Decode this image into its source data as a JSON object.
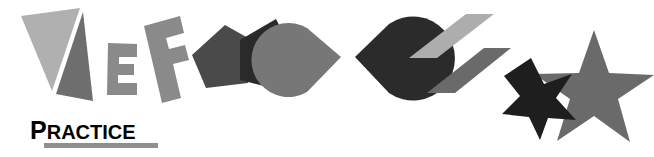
{
  "page": {
    "width": 654,
    "height": 157,
    "background": "#ffffff"
  },
  "heading": {
    "full_text": "PRACTICE",
    "drop_cap": "P",
    "rest": "RACTICE",
    "underline_color": "#8f8f8f",
    "text_color": "#000000"
  },
  "figure": {
    "pairs": [
      {
        "name": "triangle-pair",
        "shape": "triangle",
        "count": 2,
        "colors": [
          "#b0b0b0",
          "#6e6e6e"
        ],
        "labels": [
          "triangle-light",
          "triangle-dark"
        ]
      },
      {
        "name": "block-f-pair",
        "shape": "block-f",
        "count": 2,
        "colors": [
          "#8a8a8a",
          "#8a8a8a"
        ],
        "labels": [
          "block-f-small",
          "block-f-large"
        ]
      },
      {
        "name": "pentagon-pair",
        "shape": "pentagon",
        "count": 2,
        "colors": [
          "#4a4a4a",
          "#2a2a2a"
        ],
        "labels": [
          "pentagon-light",
          "pentagon-dark"
        ]
      },
      {
        "name": "pacman-pair",
        "shape": "pacman",
        "count": 2,
        "colors": [
          "#777777",
          "#2b2b2b"
        ],
        "labels": [
          "pacman-light",
          "pacman-dark"
        ]
      },
      {
        "name": "parallelogram-pair",
        "shape": "parallelogram",
        "count": 2,
        "colors": [
          "#adadad",
          "#6a6a6a"
        ],
        "labels": [
          "parallelogram-light",
          "parallelogram-dark"
        ]
      },
      {
        "name": "star-pair",
        "shape": "five-pointed-star",
        "count": 2,
        "colors": [
          "#1e1e1e",
          "#6a6a6a"
        ],
        "labels": [
          "star-small-dark",
          "star-large-gray"
        ]
      }
    ]
  },
  "colors": {
    "light_gray": "#b0b0b0",
    "mid_gray": "#8a8a8a",
    "dark_gray": "#6a6a6a",
    "near_black": "#2a2a2a",
    "black": "#1e1e1e",
    "white": "#ffffff"
  }
}
